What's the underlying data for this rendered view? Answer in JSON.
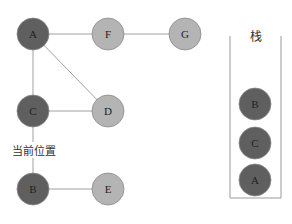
{
  "colors": {
    "visited": "#5f5f5f",
    "unvisited": "#b4b4b4",
    "edge": "#a0a0a0",
    "node_stroke": "#8a8a8a",
    "stack_border": "#9a9a9a",
    "text": "#222222"
  },
  "graph": {
    "nodes": [
      {
        "id": "A",
        "label": "A",
        "x": 33,
        "y": 34,
        "state": "visited"
      },
      {
        "id": "F",
        "label": "F",
        "x": 108,
        "y": 34,
        "state": "unvisited"
      },
      {
        "id": "G",
        "label": "G",
        "x": 185,
        "y": 34,
        "state": "unvisited"
      },
      {
        "id": "C",
        "label": "C",
        "x": 33,
        "y": 111,
        "state": "visited"
      },
      {
        "id": "D",
        "label": "D",
        "x": 108,
        "y": 111,
        "state": "unvisited"
      },
      {
        "id": "B",
        "label": "B",
        "x": 33,
        "y": 189,
        "state": "visited"
      },
      {
        "id": "E",
        "label": "E",
        "x": 108,
        "y": 189,
        "state": "unvisited"
      }
    ],
    "edges": [
      [
        "A",
        "F"
      ],
      [
        "F",
        "G"
      ],
      [
        "A",
        "C"
      ],
      [
        "A",
        "D"
      ],
      [
        "C",
        "D"
      ],
      [
        "C",
        "B"
      ],
      [
        "B",
        "E"
      ]
    ],
    "radius": 16
  },
  "current_position_label": "当前位置",
  "stack": {
    "title": "栈",
    "items_top_to_bottom": [
      "B",
      "C",
      "A"
    ]
  }
}
